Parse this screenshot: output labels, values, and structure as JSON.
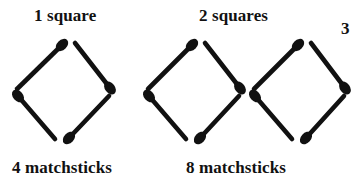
{
  "figure": {
    "title_alt": "Matchstick squares growing pattern",
    "background_color": "#ffffff",
    "ink_color": "#111111",
    "width": 353,
    "height": 188
  },
  "labels": {
    "group1_top": "1 square",
    "group1_bottom": "4 matchsticks",
    "group2_top": "2 squares",
    "group2_bottom": "8 matchsticks",
    "edge_partial": "3"
  },
  "chart_data": {
    "type": "diagram",
    "categories": [
      "1 square",
      "2 squares"
    ],
    "series": [
      {
        "name": "squares",
        "values": [
          1,
          2
        ]
      },
      {
        "name": "matchsticks",
        "values": [
          4,
          8
        ]
      }
    ],
    "xlabel": "",
    "ylabel": "",
    "grid": false,
    "legend": "none",
    "groups": [
      {
        "id": "group-1",
        "squares": 1,
        "matchsticks": 4,
        "top_label": "1 square",
        "bottom_label": "4 matchsticks"
      },
      {
        "id": "group-2",
        "squares": 2,
        "matchsticks": 8,
        "top_label": "2 squares",
        "bottom_label": "8 matchsticks"
      }
    ]
  },
  "geometry": {
    "stick_width": 4.6,
    "head_rx": 7.2,
    "head_ry": 5.0,
    "squares": [
      {
        "name": "square-1",
        "sticks": [
          {
            "name": "stick-top-left",
            "tail": [
              17,
              89
            ],
            "head": [
              62,
              45
            ]
          },
          {
            "name": "stick-top-right",
            "tail": [
              75,
              43
            ],
            "head": [
              110,
              88
            ]
          },
          {
            "name": "stick-bottom-left",
            "tail": [
              55,
              139
            ],
            "head": [
              18,
              96
            ]
          },
          {
            "name": "stick-bottom-right",
            "tail": [
              109,
              96
            ],
            "head": [
              69,
              138
            ]
          }
        ]
      },
      {
        "name": "square-2",
        "sticks": [
          {
            "name": "stick-top-left",
            "tail": [
              148,
              89
            ],
            "head": [
              192,
              45
            ]
          },
          {
            "name": "stick-top-right",
            "tail": [
              205,
              43
            ],
            "head": [
              240,
              88
            ]
          },
          {
            "name": "stick-bottom-left",
            "tail": [
              186,
              139
            ],
            "head": [
              149,
              96
            ]
          },
          {
            "name": "stick-bottom-right",
            "tail": [
              239,
              96
            ],
            "head": [
              200,
              138
            ]
          }
        ]
      },
      {
        "name": "square-3",
        "sticks": [
          {
            "name": "stick-top-left",
            "tail": [
              254,
              89
            ],
            "head": [
              298,
              45
            ]
          },
          {
            "name": "stick-top-right",
            "tail": [
              311,
              43
            ],
            "head": [
              345,
              88
            ]
          },
          {
            "name": "stick-bottom-left",
            "tail": [
              292,
              139
            ],
            "head": [
              255,
              96
            ]
          },
          {
            "name": "stick-bottom-right",
            "tail": [
              344,
              96
            ],
            "head": [
              306,
              138
            ]
          }
        ]
      }
    ]
  }
}
